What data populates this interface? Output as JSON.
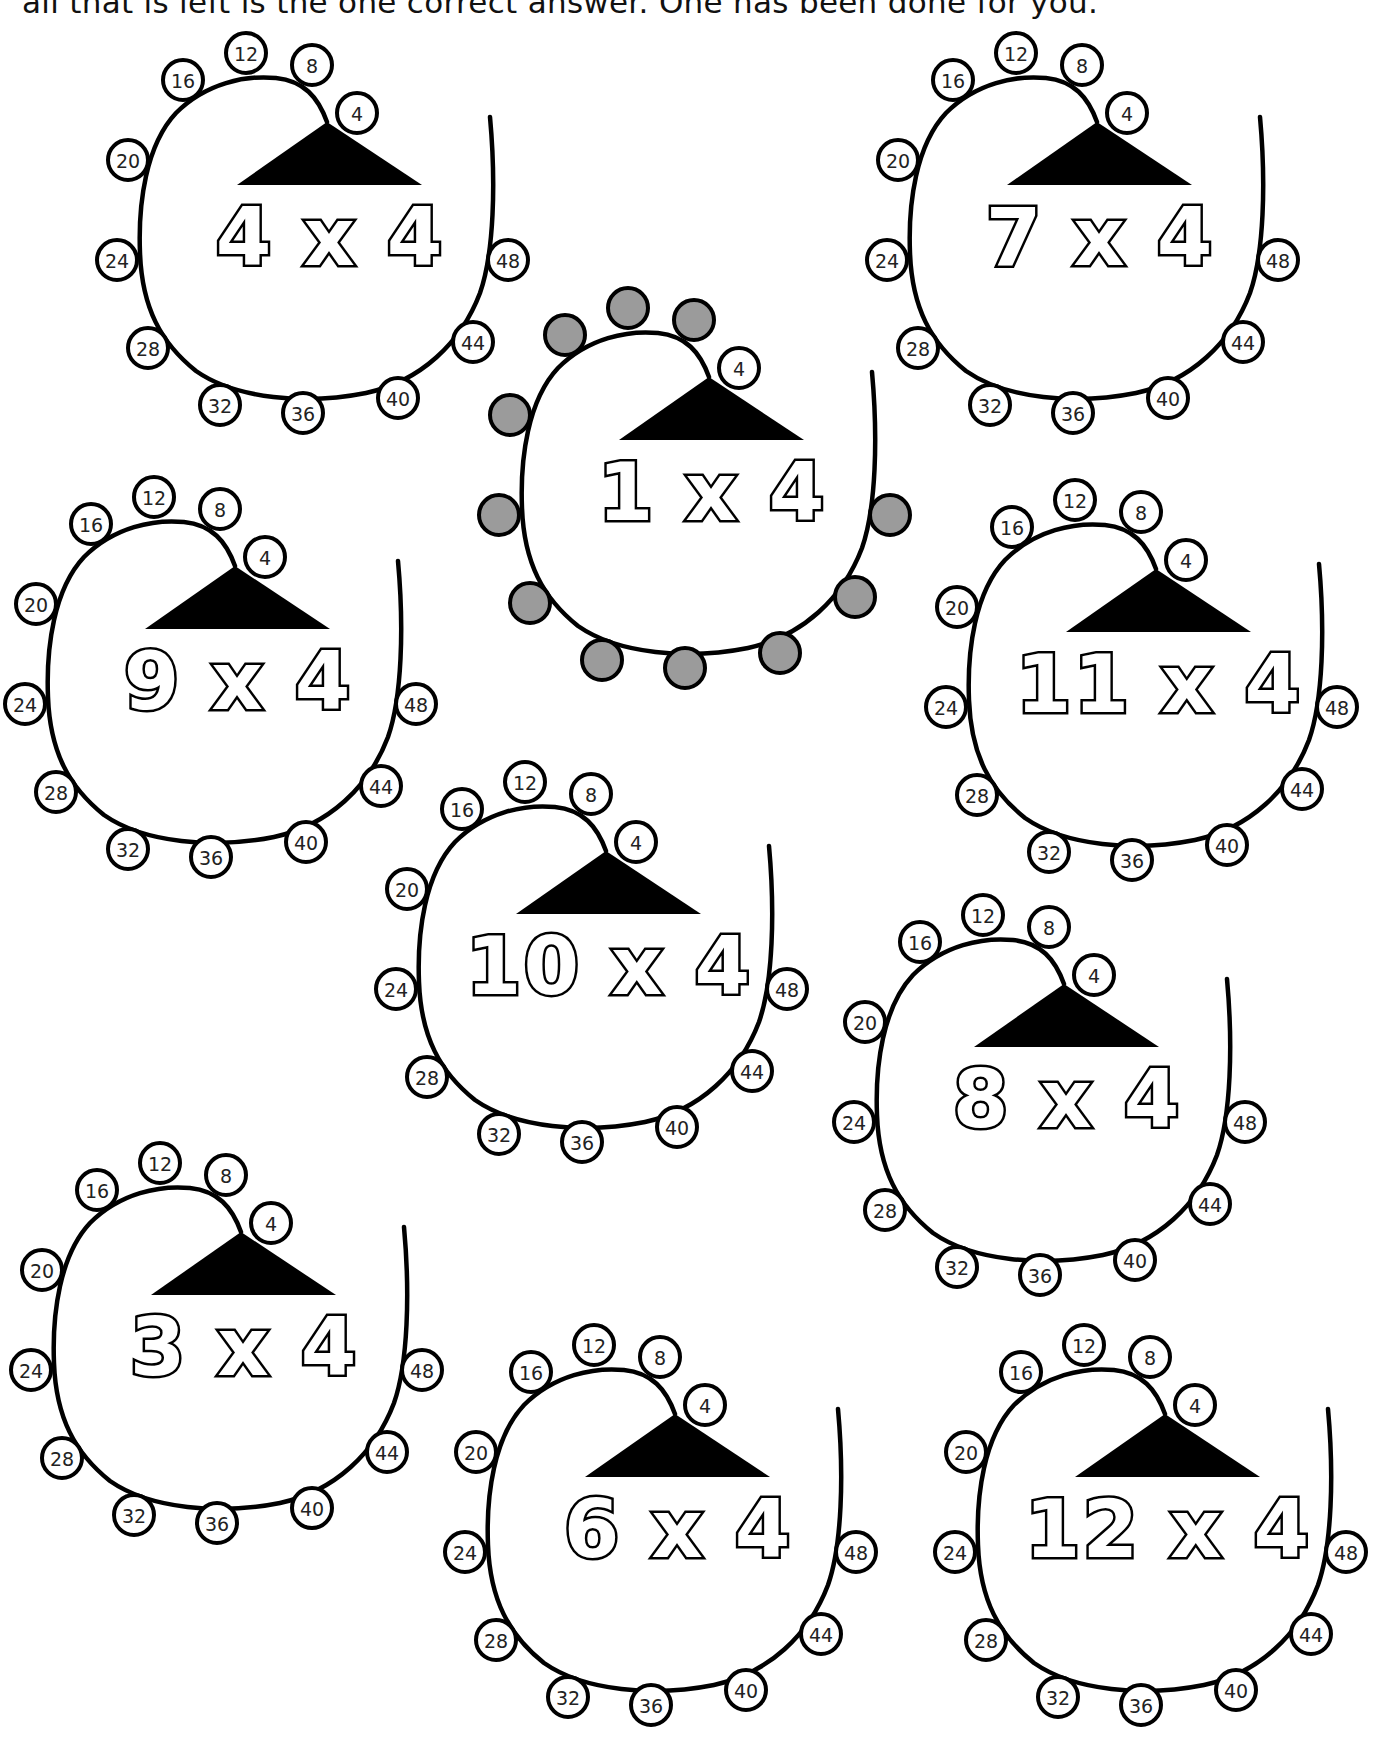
{
  "instructions": "all that is left is the one correct answer. One has been done for you.",
  "style": {
    "shaded_color": "#9b9b9b",
    "line_color": "#000000",
    "background": "#ffffff"
  },
  "bubble_numbers": [
    4,
    8,
    12,
    16,
    20,
    24,
    28,
    32,
    36,
    40,
    44,
    48
  ],
  "puzzles": [
    {
      "id": "4x4",
      "equation": "4 x 4",
      "anchor": [
        246,
        53
      ],
      "shaded": [],
      "example": false
    },
    {
      "id": "7x4",
      "equation": "7 x 4",
      "anchor": [
        1016,
        53
      ],
      "shaded": [],
      "example": false
    },
    {
      "id": "1x4",
      "equation": "1 x 4",
      "anchor": [
        628,
        308
      ],
      "shaded": [
        8,
        12,
        16,
        20,
        24,
        28,
        32,
        36,
        40,
        44,
        48
      ],
      "example": true
    },
    {
      "id": "9x4",
      "equation": "9 x 4",
      "anchor": [
        154,
        497
      ],
      "shaded": [],
      "example": false
    },
    {
      "id": "11x4",
      "equation": "11 x 4",
      "anchor": [
        1075,
        500
      ],
      "shaded": [],
      "example": false
    },
    {
      "id": "10x4",
      "equation": "10 x 4",
      "anchor": [
        525,
        782
      ],
      "shaded": [],
      "example": false
    },
    {
      "id": "8x4",
      "equation": "8 x 4",
      "anchor": [
        983,
        915
      ],
      "shaded": [],
      "example": false
    },
    {
      "id": "3x4",
      "equation": "3 x 4",
      "anchor": [
        160,
        1163
      ],
      "shaded": [],
      "example": false
    },
    {
      "id": "6x4",
      "equation": "6 x 4",
      "anchor": [
        594,
        1345
      ],
      "shaded": [],
      "example": false
    },
    {
      "id": "12x4",
      "equation": "12 x 4",
      "anchor": [
        1084,
        1345
      ],
      "shaded": [],
      "example": false
    }
  ]
}
